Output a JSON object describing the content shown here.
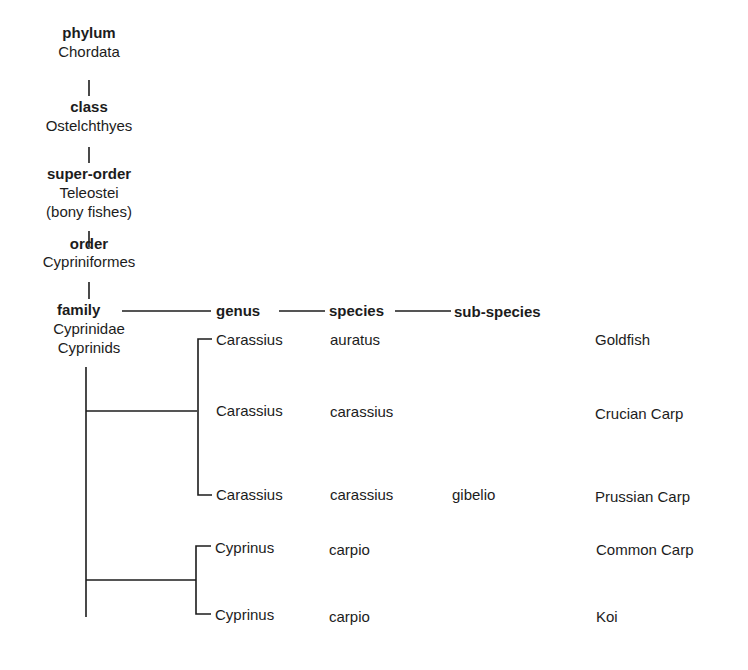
{
  "hierarchy": [
    {
      "rank": "phylum",
      "name": "Chordata"
    },
    {
      "rank": "class",
      "name": "Ostelchthyes"
    },
    {
      "rank": "super-order",
      "name": "Teleostei",
      "note": "(bony fishes)"
    },
    {
      "rank": "order",
      "name": "Cypriniformes"
    },
    {
      "rank": "family",
      "name": "Cyprinidae",
      "common": "Cyprinids"
    }
  ],
  "columns": {
    "genus": "genus",
    "species": "species",
    "subspecies": "sub-species"
  },
  "rows": [
    {
      "genus": "Carassius",
      "species": "auratus",
      "subspecies": "",
      "common": "Goldfish"
    },
    {
      "genus": "Carassius",
      "species": "carassius",
      "subspecies": "",
      "common": "Crucian Carp"
    },
    {
      "genus": "Carassius",
      "species": "carassius",
      "subspecies": "gibelio",
      "common": "Prussian Carp"
    },
    {
      "genus": "Cyprinus",
      "species": "carpio",
      "subspecies": "",
      "common": "Common Carp"
    },
    {
      "genus": "Cyprinus",
      "species": "carpio",
      "subspecies": "",
      "common": "Koi"
    }
  ],
  "colors": {
    "ink": "#1c1c1c",
    "background": "#ffffff"
  }
}
